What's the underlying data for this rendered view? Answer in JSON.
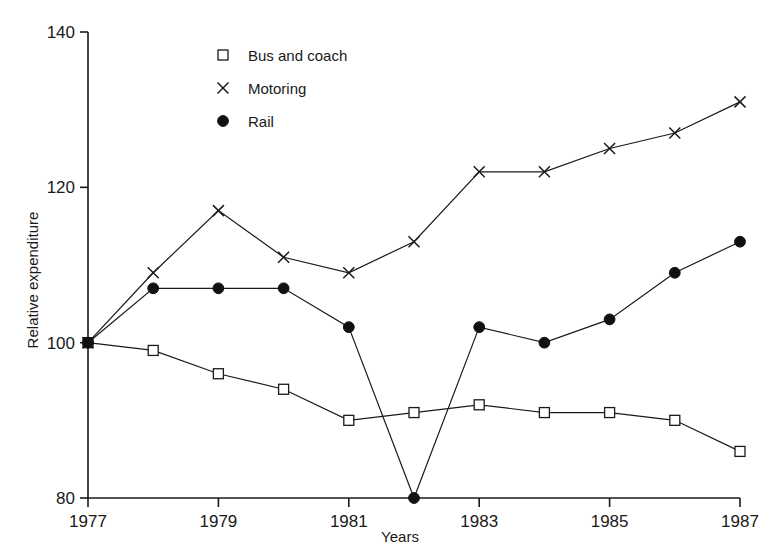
{
  "chart_data": {
    "type": "line",
    "title": "",
    "xlabel": "Years",
    "ylabel": "Relative expenditure",
    "x": [
      1977,
      1978,
      1979,
      1980,
      1981,
      1982,
      1983,
      1984,
      1985,
      1986,
      1987
    ],
    "xlim": [
      1977,
      1987
    ],
    "ylim": [
      80,
      140
    ],
    "xticks": [
      1977,
      1979,
      1981,
      1983,
      1985,
      1987
    ],
    "xticklabels": [
      "1977",
      "1979",
      "1981",
      "1983",
      "1985",
      "1987"
    ],
    "yticks": [
      80,
      100,
      120,
      140
    ],
    "yticklabels": [
      "80",
      "100",
      "120",
      "140"
    ],
    "grid": false,
    "legend_position": "upper-left-inside",
    "series": [
      {
        "name": "Bus and coach",
        "marker": "open-square",
        "values": [
          100,
          99,
          96,
          94,
          90,
          91,
          92,
          91,
          91,
          90,
          86
        ]
      },
      {
        "name": "Motoring",
        "marker": "cross",
        "values": [
          100,
          109,
          117,
          111,
          109,
          113,
          122,
          122,
          125,
          127,
          131
        ]
      },
      {
        "name": "Rail",
        "marker": "filled-circle",
        "values": [
          100,
          107,
          107,
          107,
          102,
          80,
          102,
          100,
          103,
          109,
          113
        ]
      }
    ]
  },
  "legend": {
    "items": [
      {
        "label": "Bus and coach",
        "marker": "open-square"
      },
      {
        "label": "Motoring",
        "marker": "cross"
      },
      {
        "label": "Rail",
        "marker": "filled-circle"
      }
    ]
  },
  "axes": {
    "y_title": "Relative expenditure",
    "x_title": "Years"
  }
}
